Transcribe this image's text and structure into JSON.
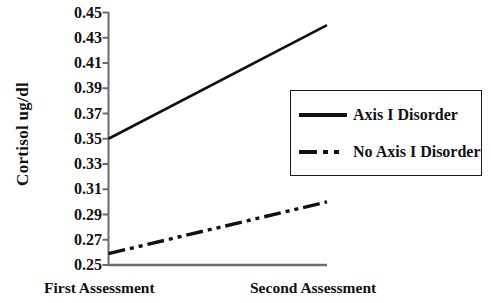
{
  "chart_data": {
    "type": "line",
    "title": "",
    "xlabel": "",
    "ylabel": "Cortisol  ug/dl",
    "categories": [
      "First Assessment",
      "Second Assessment"
    ],
    "x": [
      0,
      1
    ],
    "ylim": [
      0.25,
      0.45
    ],
    "ytick_labels": [
      "0.45",
      "0.43",
      "0.41",
      "0.39",
      "0.37",
      "0.35",
      "0.33",
      "0.31",
      "0.29",
      "0.27",
      "0.25"
    ],
    "ytick_values": [
      0.45,
      0.43,
      0.41,
      0.39,
      0.37,
      0.35,
      0.33,
      0.31,
      0.29,
      0.27,
      0.25
    ],
    "grid": false,
    "legend_position": "center-right",
    "series": [
      {
        "name": "Axis I Disorder",
        "style": "solid",
        "color": "#111111",
        "values": [
          0.35,
          0.44
        ]
      },
      {
        "name": "No Axis I Disorder",
        "style": "dash-dot-dot",
        "color": "#111111",
        "values": [
          0.259,
          0.3
        ]
      }
    ]
  },
  "axis": {
    "y_title": "Cortisol  ug/dl",
    "x_labels": {
      "first": "First Assessment",
      "second": "Second Assessment"
    }
  },
  "legend": {
    "entries": [
      {
        "label": "Axis I Disorder",
        "swatch": "solid-line-swatch"
      },
      {
        "label": "No Axis I Disorder",
        "swatch": "dash-dot-line-swatch"
      }
    ]
  },
  "colors": {
    "axis": "#6b6b6b",
    "line": "#111111",
    "text": "#111111",
    "background": "#ffffff"
  }
}
